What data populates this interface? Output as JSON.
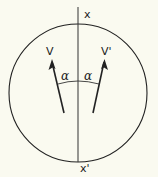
{
  "diagram": {
    "labels": {
      "axis_top": "x",
      "axis_bottom": "x'",
      "vector_left": "V",
      "vector_right": "V'",
      "angle_left": "α",
      "angle_right": "α"
    },
    "colors": {
      "background": "#fafaf0",
      "stroke": "#222222"
    }
  }
}
